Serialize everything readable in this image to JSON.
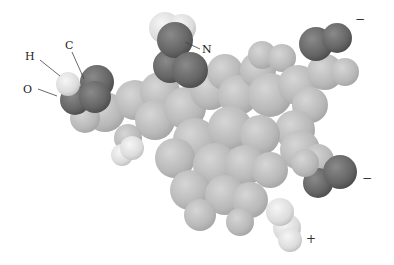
{
  "figure": {
    "labels": {
      "h": "H",
      "c": "C",
      "o": "O",
      "n": "N"
    },
    "charges": {
      "top_right": "−",
      "right": "−",
      "bottom": "+"
    },
    "colors": {
      "background": "#ffffff",
      "body_atom": "#bdbdbd",
      "dark_atom": "#6a6a6a",
      "light_atom": "#e8e8e8",
      "label_text": "#222222"
    }
  }
}
